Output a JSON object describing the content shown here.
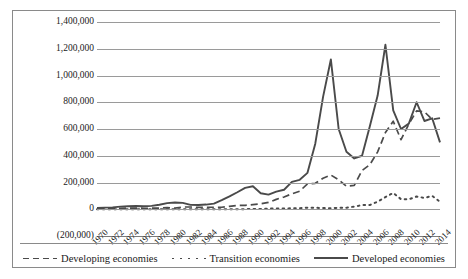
{
  "chart_data": {
    "type": "line",
    "title": "",
    "xlabel": "",
    "ylabel": "",
    "ylim": [
      -200000,
      1400000
    ],
    "ytick_labels": [
      "1,400,000",
      "1,200,000",
      "1,000,000",
      "800,000",
      "600,000",
      "400,000",
      "200,000",
      "0",
      "(200,000)"
    ],
    "ytick_values": [
      1400000,
      1200000,
      1000000,
      800000,
      600000,
      400000,
      200000,
      0,
      -200000
    ],
    "grid": true,
    "legend_position": "bottom",
    "x": [
      1970,
      1971,
      1972,
      1973,
      1974,
      1975,
      1976,
      1977,
      1978,
      1979,
      1980,
      1981,
      1982,
      1983,
      1984,
      1985,
      1986,
      1987,
      1988,
      1989,
      1990,
      1991,
      1992,
      1993,
      1994,
      1995,
      1996,
      1997,
      1998,
      1999,
      2000,
      2001,
      2002,
      2003,
      2004,
      2005,
      2006,
      2007,
      2008,
      2009,
      2010,
      2011,
      2012,
      2013,
      2014
    ],
    "xtick_labels": [
      "1970",
      "1972",
      "1974",
      "1976",
      "1978",
      "1980",
      "1982",
      "1984",
      "1986",
      "1988",
      "1990",
      "1992",
      "1994",
      "1996",
      "1998",
      "2000",
      "2002",
      "2004",
      "2006",
      "2008",
      "2010",
      "2012",
      "2014"
    ],
    "series": [
      {
        "name": "Developed economies",
        "style": "solid",
        "color": "#4a4a4a",
        "values": [
          10000,
          12000,
          14000,
          20000,
          22000,
          24000,
          22000,
          25000,
          34000,
          46000,
          50000,
          48000,
          33000,
          32000,
          35000,
          42000,
          68000,
          96000,
          127000,
          160000,
          172000,
          120000,
          109000,
          132000,
          146000,
          205000,
          220000,
          272000,
          490000,
          840000,
          1120000,
          600000,
          430000,
          380000,
          400000,
          620000,
          850000,
          1230000,
          740000,
          600000,
          640000,
          800000,
          660000,
          680000,
          500000
        ]
      },
      {
        "name": "Developing economies",
        "style": "dashed",
        "color": "#4a4a4a",
        "values": [
          4000,
          5000,
          5500,
          7000,
          8000,
          9000,
          7000,
          8000,
          9000,
          12000,
          9000,
          17000,
          17000,
          14000,
          14000,
          15000,
          15000,
          22000,
          29000,
          29000,
          35000,
          41000,
          51000,
          74000,
          92000,
          115000,
          135000,
          190000,
          194000,
          232000,
          256000,
          220000,
          172000,
          178000,
          290000,
          333000,
          429000,
          574000,
          658000,
          520000,
          637000,
          735000,
          729000,
          671000,
          681000
        ]
      },
      {
        "name": "Transition economies",
        "style": "dotted",
        "color": "#4a4a4a",
        "values": [
          0,
          0,
          0,
          0,
          0,
          0,
          0,
          0,
          0,
          0,
          0,
          0,
          0,
          0,
          0,
          0,
          100,
          200,
          500,
          900,
          1100,
          2500,
          4500,
          6200,
          6100,
          6700,
          7400,
          12000,
          11000,
          9000,
          7000,
          11000,
          12000,
          20000,
          31000,
          31000,
          57000,
          91000,
          122000,
          75000,
          74000,
          95000,
          85000,
          100000,
          56000
        ]
      }
    ]
  }
}
